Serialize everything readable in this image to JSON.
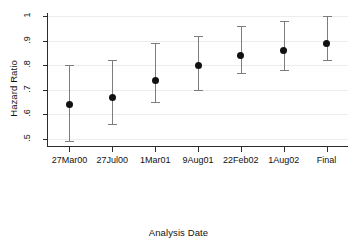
{
  "chart_data": {
    "type": "scatter",
    "title": "",
    "xlabel": "Analysis Date",
    "ylabel": "Hazard Ratio",
    "categories": [
      "27Mar00",
      "27Jul00",
      "1Mar01",
      "9Aug01",
      "22Feb02",
      "1Aug02",
      "Final"
    ],
    "values": [
      0.64,
      0.67,
      0.74,
      0.8,
      0.84,
      0.86,
      0.89
    ],
    "error_low": [
      0.49,
      0.56,
      0.65,
      0.7,
      0.77,
      0.78,
      0.82
    ],
    "error_high": [
      0.8,
      0.82,
      0.89,
      0.92,
      0.96,
      0.98,
      1.0
    ],
    "ylim": [
      0.47,
      1.01
    ],
    "yticks": [
      1,
      0.9,
      0.8,
      0.7,
      0.6,
      0.5
    ],
    "ytick_labels": [
      "1",
      ".9",
      ".8",
      ".7",
      ".6",
      ".5"
    ],
    "grid": true,
    "legend": "none",
    "marker_color": "#111111",
    "whisker_color": "#7d7d7d",
    "grid_color": "#ececec",
    "axis_color": "#2b2b2b"
  }
}
